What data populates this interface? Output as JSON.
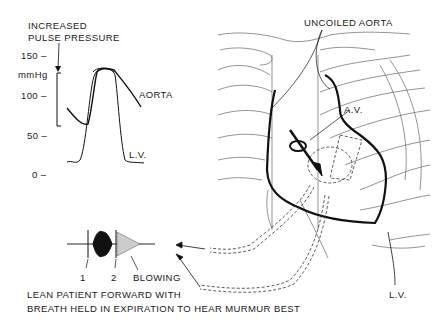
{
  "pressure_chart": {
    "title_line1": "INCREASED",
    "title_line2": "PULSE PRESSURE",
    "unit": "mmHg",
    "ticks": [
      "150 –",
      "100 –",
      "50 –",
      "0 –"
    ],
    "tick_values": [
      150,
      100,
      50,
      0
    ],
    "series": [
      {
        "name": "AORTA",
        "label": "AORTA"
      },
      {
        "name": "L.V.",
        "label": "L.V."
      }
    ],
    "pulse_pressure_range": [
      60,
      125
    ]
  },
  "heart": {
    "uncoiled_aorta_label": "UNCOILED AORTA",
    "av_label": "A.V.",
    "lv_label": "L.V."
  },
  "phonocardiogram": {
    "s1_label": "1",
    "s2_label": "2",
    "murmur_label": "BLOWING"
  },
  "instructions": {
    "line1": "LEAN PATIENT FORWARD WITH",
    "line2": "BREATH HELD IN EXPIRATION TO HEAR MURMUR BEST"
  }
}
